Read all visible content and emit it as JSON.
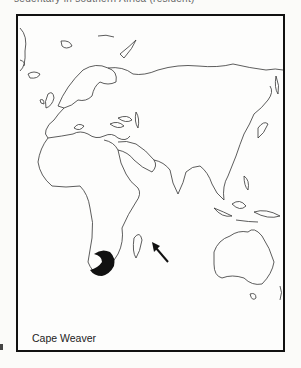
{
  "header": {
    "partial_text": "sedentary in southern Africa (resident)"
  },
  "map": {
    "title": "Cape Weaver",
    "region": "Eastern Hemisphere (Europe, Africa, Asia, Australia)",
    "range_color": "#111111",
    "outline_color": "#333333",
    "range_label": "Southern Africa (South Africa)",
    "arrow": {
      "direction": "pointing up-left",
      "target": "Madagascar / southern Africa"
    }
  }
}
